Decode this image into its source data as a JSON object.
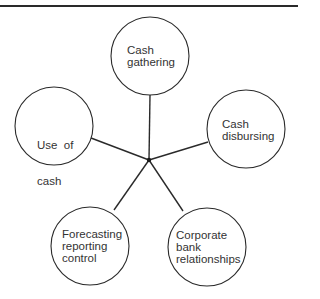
{
  "diagram": {
    "hub": {
      "x": 149,
      "y": 160
    },
    "colors": {
      "line": "#2a2a2a",
      "text": "#333333",
      "background": "#ffffff"
    },
    "nodes": [
      {
        "id": "cash-gathering",
        "lines": [
          "Cash",
          "gathering"
        ],
        "cx": 150,
        "cy": 56,
        "r": 39
      },
      {
        "id": "use-of-cash",
        "lines": [
          "Use  of",
          "cash"
        ],
        "cx": 54,
        "cy": 126,
        "r": 39
      },
      {
        "id": "cash-disbursing",
        "lines": [
          "Cash",
          "disbursing"
        ],
        "cx": 246,
        "cy": 129,
        "r": 39
      },
      {
        "id": "forecasting-reporting-control",
        "lines": [
          "Forecasting",
          "reporting",
          "control"
        ],
        "cx": 90,
        "cy": 246,
        "r": 39
      },
      {
        "id": "corporate-bank-relationships",
        "lines": [
          "Corporate",
          "bank",
          "relationships"
        ],
        "cx": 207,
        "cy": 247,
        "r": 39
      }
    ],
    "labels": {
      "cash_gathering": "Cash\ngathering",
      "use_of_cash": "Use  of\ncash",
      "cash_disbursing": "Cash\ndisbursing",
      "forecasting": "Forecasting\nreporting\ncontrol",
      "corporate_bank": "Corporate\nbank\nrelationships"
    }
  }
}
